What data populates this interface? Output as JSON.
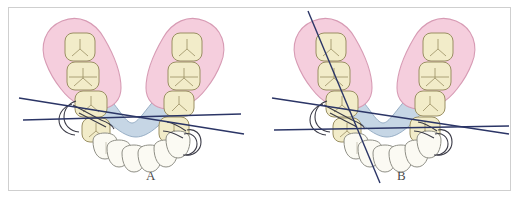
{
  "figure": {
    "type": "medical-illustration",
    "frame_border_color": "#cfcfcf",
    "background_color": "#ffffff"
  },
  "colors": {
    "ridge_pink": "#f5cedd",
    "ridge_pink_edge": "#d79bb4",
    "connector_blue": "#c3d4e4",
    "connector_blue_edge": "#8aa4bd",
    "molar_cream": "#f2ecc9",
    "molar_edge": "#9a8f63",
    "incisor_white": "#fbfaf3",
    "incisor_edge": "#8f8f86",
    "survey_line": "#2b3566",
    "outline_dark": "#3a3a46",
    "label_text": "#4a4a4a"
  },
  "panels": [
    {
      "id": "A",
      "label": "A",
      "survey_lines": [
        {
          "name": "survey-line-left-descending",
          "x1": 18,
          "y1": 97,
          "x2": 243,
          "y2": 133
        },
        {
          "name": "survey-line-right-ascending",
          "x1": 22,
          "y1": 119,
          "x2": 240,
          "y2": 113
        }
      ],
      "left_ridge_teeth": 3,
      "right_ridge_teeth": 4,
      "anterior_teeth": 6
    },
    {
      "id": "B",
      "label": "B",
      "survey_lines": [
        {
          "name": "survey-line-left-descending",
          "x1": 268,
          "y1": 97,
          "x2": 500,
          "y2": 133
        },
        {
          "name": "survey-line-right-ascending",
          "x1": 272,
          "y1": 128,
          "x2": 502,
          "y2": 124
        },
        {
          "name": "survey-line-steep-diagonal",
          "x1": 305,
          "y1": 10,
          "x2": 376,
          "y2": 181
        }
      ],
      "left_ridge_teeth": 3,
      "right_ridge_teeth": 4,
      "anterior_teeth": 6
    }
  ],
  "legend": {
    "pink_region": "edentulous-ridge-pad",
    "blue_region": "lingual-major-connector",
    "cream_teeth": "posterior-molars",
    "white_teeth": "anterior-incisors",
    "dark_lines": "clasp-assembly-and-survey-lines"
  }
}
